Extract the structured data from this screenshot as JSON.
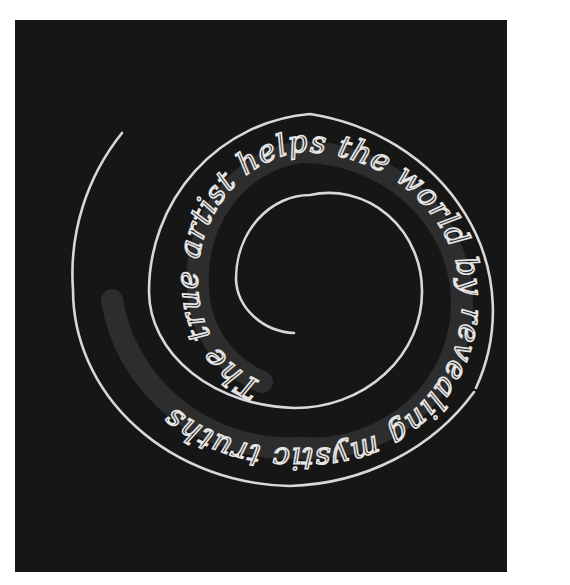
{
  "artwork": {
    "background_color": "#161616",
    "neon_color": "#d8d8d8",
    "text": "The true artist helps the world by revealing mystic truths",
    "segments": [
      {
        "id": "the-true",
        "text": "The true"
      },
      {
        "id": "artist-helps-the-world",
        "text": "artist helps the world"
      },
      {
        "id": "by-revealing-mystic",
        "text": "by revealing mystic"
      },
      {
        "id": "truths",
        "text": "truths"
      }
    ]
  }
}
